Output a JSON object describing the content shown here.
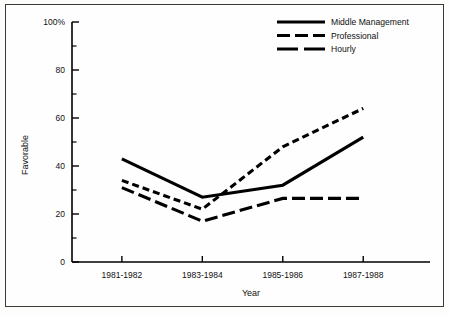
{
  "chart_data": {
    "type": "line",
    "title": "",
    "xlabel": "Year",
    "ylabel": "Favorable",
    "categories": [
      "1981-1982",
      "1983-1984",
      "1985-1986",
      "1987-1988"
    ],
    "ylim": [
      0,
      100
    ],
    "xlim_index": [
      0,
      3
    ],
    "ytick_labels": [
      "0",
      "20",
      "40",
      "60",
      "80",
      "100%"
    ],
    "ytick_values": [
      0,
      20,
      40,
      60,
      80,
      100
    ],
    "yminor_values": [
      10,
      30,
      50,
      70,
      90
    ],
    "grid": false,
    "legend_position": "top-right",
    "series": [
      {
        "name": "Middle Management",
        "style": "solid",
        "color": "#000000",
        "values": [
          43,
          27,
          32,
          52
        ]
      },
      {
        "name": "Professional",
        "style": "short-dash",
        "color": "#000000",
        "values": [
          34,
          22,
          48,
          64
        ]
      },
      {
        "name": "Hourly",
        "style": "long-dash",
        "color": "#000000",
        "values": [
          31,
          17,
          26.5,
          26.5
        ]
      }
    ]
  },
  "legend": {
    "items": [
      {
        "label": "Middle Management",
        "style": "solid"
      },
      {
        "label": "Professional",
        "style": "short-dash"
      },
      {
        "label": "Hourly",
        "style": "long-dash"
      }
    ]
  },
  "axes": {
    "y_title": "Favorable",
    "x_title": "Year"
  }
}
